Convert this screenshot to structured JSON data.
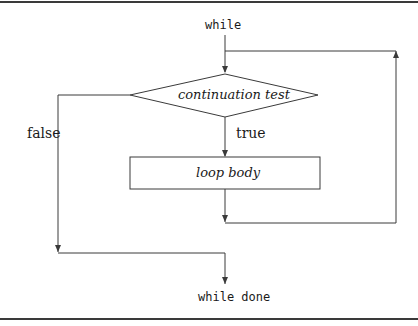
{
  "diagram": {
    "colors": {
      "line": "#3a3a3a",
      "text": "#1a1a1a",
      "background": "#ffffff"
    },
    "nodes": {
      "start": {
        "label": "while",
        "font": "mono"
      },
      "condition": {
        "label": "continuation test",
        "shape": "diamond",
        "style": "italic"
      },
      "body": {
        "label": "loop body",
        "shape": "rectangle",
        "style": "italic"
      },
      "end": {
        "label": "while done",
        "font": "mono"
      }
    },
    "edges": {
      "true_label": "true",
      "false_label": "false"
    }
  }
}
